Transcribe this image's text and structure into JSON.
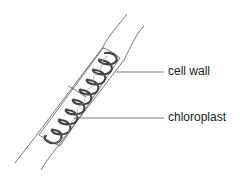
{
  "diagram": {
    "labels": [
      {
        "id": "cell-wall",
        "text": "cell wall"
      },
      {
        "id": "chloroplast",
        "text": "chloroplast"
      }
    ]
  }
}
